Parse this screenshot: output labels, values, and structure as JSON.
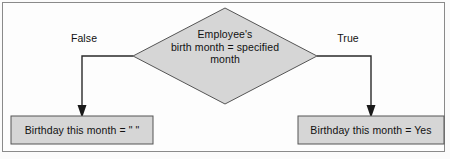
{
  "diagram": {
    "type": "flowchart",
    "frame": {
      "border_color": "#8a8a8a",
      "background": "#fdfdfd"
    },
    "palette": {
      "shape_fill": "#d6d6d6",
      "shape_stroke": "#555555",
      "connector": "#2a2a2a",
      "text": "#111111"
    },
    "decision": {
      "shape": "diamond",
      "line1": "Employee's",
      "line2": "birth month = specified",
      "line3": "month"
    },
    "edges": [
      {
        "label": "False",
        "direction": "left",
        "target": "empty-result-box"
      },
      {
        "label": "True",
        "direction": "right",
        "target": "yes-result-box"
      }
    ],
    "result_boxes": [
      {
        "name": "empty-result-box",
        "text": "Birthday this month = \" \""
      },
      {
        "name": "yes-result-box",
        "text": "Birthday this month = Yes"
      }
    ]
  }
}
